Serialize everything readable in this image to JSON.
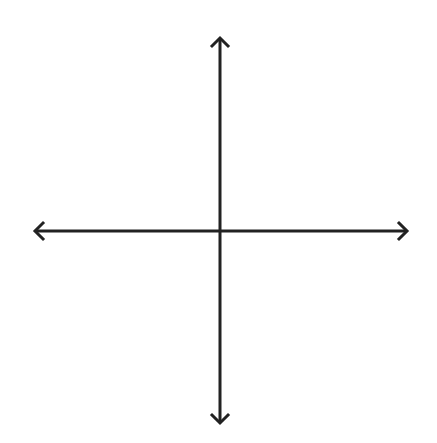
{
  "diagram": {
    "type": "coordinate-axes",
    "origin": {
      "x": 220,
      "y": 231
    },
    "x_axis": {
      "x1": 33,
      "x2": 409,
      "y": 231,
      "arrows": "both"
    },
    "y_axis": {
      "y1": 36,
      "y2": 425,
      "x": 220,
      "arrows": "both"
    },
    "stroke_color": "#222222",
    "stroke_width": 3,
    "background_color": "#ffffff"
  }
}
